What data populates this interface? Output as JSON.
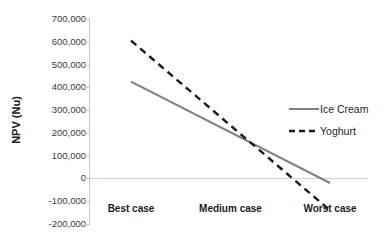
{
  "chart_data": {
    "type": "line",
    "title": "",
    "subtitle": "",
    "xlabel": "",
    "ylabel": "NPV (Nu)",
    "categories": [
      "Best case",
      "Medium case",
      "Worst case"
    ],
    "series": [
      {
        "name": "Ice Cream",
        "values": [
          425000,
          165000,
          -20000
        ],
        "style": "solid",
        "color": "#808080"
      },
      {
        "name": "Yoghurt",
        "values": [
          605000,
          165000,
          -140000
        ],
        "style": "dashed",
        "color": "#1a1a1a"
      }
    ],
    "ylim": [
      -200000,
      700000
    ],
    "ytick_labels": [
      "700,000",
      "600,000",
      "500,000",
      "400,000",
      "300,000",
      "200,000",
      "100,000",
      "0",
      "-100,000",
      "-200,000"
    ],
    "ytick_values": [
      700000,
      600000,
      500000,
      400000,
      300000,
      200000,
      100000,
      0,
      -100000,
      -200000
    ],
    "grid": false,
    "zero_line": true,
    "legend_position": "right",
    "legend": [
      {
        "label": "Ice Cream",
        "style": "solid",
        "color": "#808080"
      },
      {
        "label": "Yoghurt",
        "style": "dashed",
        "color": "#1a1a1a"
      }
    ]
  },
  "axis": {
    "y_title": "NPV (Nu)"
  }
}
